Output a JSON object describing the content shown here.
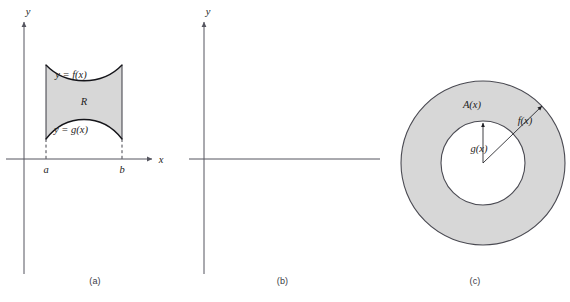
{
  "figure": {
    "background": "#ffffff",
    "region_fill": "#d7d7d7",
    "curve_color": "#15151a",
    "axis_color": "#55555f"
  },
  "panels": [
    {
      "id": "a",
      "caption": "(a)",
      "axes": {
        "x_label": "x",
        "y_label": "y"
      },
      "ticks": [
        {
          "name": "a",
          "label": "a"
        },
        {
          "name": "b",
          "label": "b"
        }
      ],
      "labels": {
        "upper_curve": "y = f(x)",
        "lower_curve": "y = g(x)",
        "region": "R"
      }
    },
    {
      "id": "b",
      "caption": "(b)",
      "axes": {
        "x_label": "x",
        "y_label": "y"
      },
      "ticks": [
        {
          "name": "a",
          "label": "a"
        },
        {
          "name": "x",
          "label": "x"
        },
        {
          "name": "b",
          "label": "b"
        }
      ],
      "labels": {
        "cross_section": "A(x)",
        "solid": "S"
      }
    },
    {
      "id": "c",
      "caption": "(c)",
      "labels": {
        "annulus_area": "A(x)",
        "outer_radius": "f(x)",
        "inner_radius": "g(x)"
      }
    }
  ]
}
